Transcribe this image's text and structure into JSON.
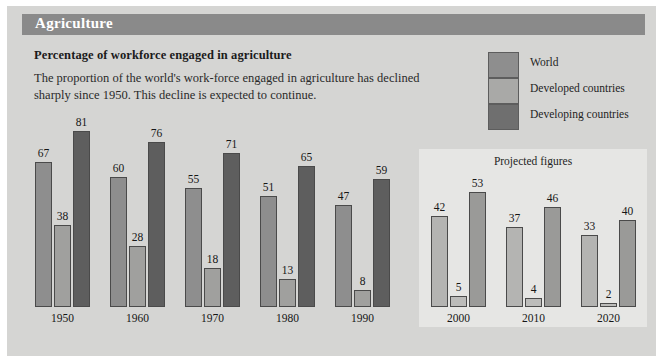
{
  "header": {
    "title": "Agriculture"
  },
  "subtitle": "Percentage of workforce engaged in agriculture",
  "body_text": "The proportion of the world's work-force engaged in agriculture has declined sharply since 1950. This decline is expected to continue.",
  "legend": {
    "items": [
      {
        "label": "World",
        "color": "#8e8e8e"
      },
      {
        "label": "Developed countries",
        "color": "#a9a9a7"
      },
      {
        "label": "Developing countries",
        "color": "#6f6f6f"
      }
    ]
  },
  "projected": {
    "title": "Projected figures",
    "background": "#e6e6e4",
    "start_category": "2000"
  },
  "colors": {
    "panel_background": "#d5d5d3",
    "title_bar": "#8a8a8a",
    "title_text": "#ffffff",
    "bar_border": "#4a4a4a",
    "world_actual": "#8e8e8e",
    "developed_actual": "#a0a09e",
    "developing_actual": "#5e5e5e",
    "world_projected": "#b4b4b2",
    "developed_projected": "#bcbcba",
    "developing_projected": "#9a9a98"
  },
  "chart_data": {
    "type": "bar",
    "title": "Percentage of workforce engaged in agriculture",
    "xlabel": "",
    "ylabel": "",
    "ylim": [
      0,
      81
    ],
    "grid": false,
    "legend_position": "top-right",
    "categories": [
      "1950",
      "1960",
      "1970",
      "1980",
      "1990",
      "2000",
      "2010",
      "2020"
    ],
    "projected_categories": [
      "2000",
      "2010",
      "2020"
    ],
    "series": [
      {
        "name": "World",
        "values": [
          67,
          60,
          55,
          51,
          47,
          42,
          37,
          33
        ]
      },
      {
        "name": "Developed countries",
        "values": [
          38,
          28,
          18,
          13,
          8,
          5,
          4,
          2
        ]
      },
      {
        "name": "Developing countries",
        "values": [
          81,
          76,
          71,
          65,
          59,
          53,
          46,
          40
        ]
      }
    ],
    "annotations": [
      "Projected figures"
    ]
  }
}
